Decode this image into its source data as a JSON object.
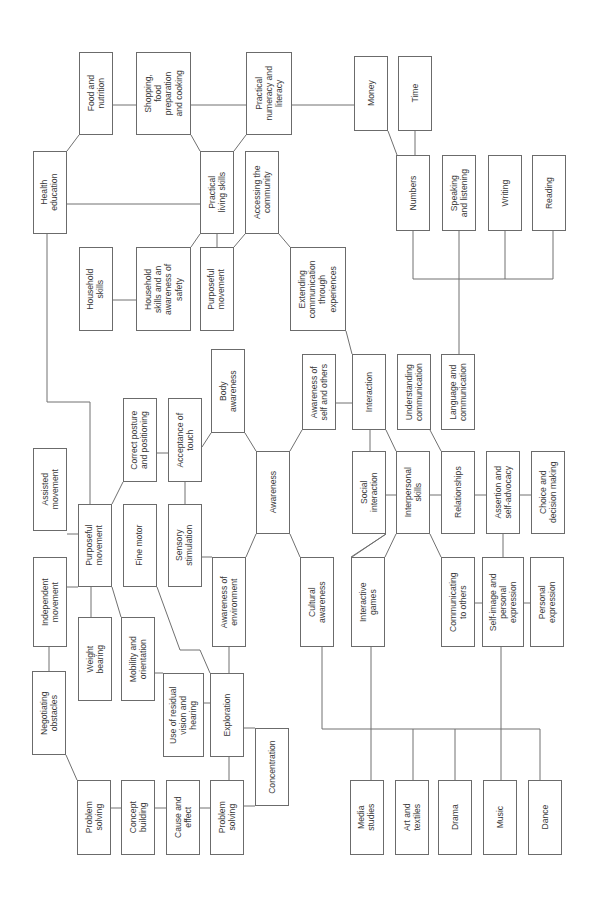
{
  "diagram": {
    "title": "",
    "orientation": "rotated-90-ccw",
    "colors": {
      "line": "#707070",
      "box_border": "#6b6b6b",
      "text": "#3a3a3a",
      "background": "#ffffff"
    },
    "nodes": [
      {
        "id": "food_nutrition",
        "label": "Food and\nnutrition",
        "x": 79,
        "y": 52,
        "w": 34,
        "h": 83
      },
      {
        "id": "shopping",
        "label": "Shopping,\nfood\npreparation\nand cooking",
        "x": 136,
        "y": 52,
        "w": 55,
        "h": 83
      },
      {
        "id": "practical_numeracy",
        "label": "Practical\nnumeracy and\nliteracy",
        "x": 246,
        "y": 52,
        "w": 46,
        "h": 83
      },
      {
        "id": "money",
        "label": "Money",
        "x": 354,
        "y": 56,
        "w": 34,
        "h": 75
      },
      {
        "id": "time",
        "label": "Time",
        "x": 398,
        "y": 56,
        "w": 34,
        "h": 75
      },
      {
        "id": "health_education",
        "label": "Health\neducation",
        "x": 33,
        "y": 151,
        "w": 34,
        "h": 83
      },
      {
        "id": "practical_living",
        "label": "Practical\nliving skills",
        "x": 200,
        "y": 151,
        "w": 34,
        "h": 83
      },
      {
        "id": "accessing_community",
        "label": "Accessing the\ncommunity",
        "x": 245,
        "y": 151,
        "w": 34,
        "h": 83
      },
      {
        "id": "numbers",
        "label": "Numbers",
        "x": 396,
        "y": 155,
        "w": 34,
        "h": 76
      },
      {
        "id": "speaking_listening",
        "label": "Speaking\nand listening",
        "x": 442,
        "y": 155,
        "w": 34,
        "h": 76
      },
      {
        "id": "writing",
        "label": "Writing",
        "x": 488,
        "y": 155,
        "w": 34,
        "h": 76
      },
      {
        "id": "reading",
        "label": "Reading",
        "x": 532,
        "y": 155,
        "w": 34,
        "h": 76
      },
      {
        "id": "household_skills",
        "label": "Household\nskills",
        "x": 79,
        "y": 247,
        "w": 34,
        "h": 84
      },
      {
        "id": "household_safety",
        "label": "Household\nskills and an\nawareness of\nsafety",
        "x": 136,
        "y": 247,
        "w": 55,
        "h": 84
      },
      {
        "id": "purposeful_movement_top",
        "label": "Purposeful\nmovement",
        "x": 200,
        "y": 247,
        "w": 34,
        "h": 84
      },
      {
        "id": "extending_communication",
        "label": "Extending\ncommunication\nthrough\nexperiences",
        "x": 290,
        "y": 247,
        "w": 56,
        "h": 84
      },
      {
        "id": "body_awareness",
        "label": "Body\nawareness",
        "x": 211,
        "y": 349,
        "w": 34,
        "h": 84
      },
      {
        "id": "correct_posture",
        "label": "Correct posture\nand positioning",
        "x": 123,
        "y": 398,
        "w": 34,
        "h": 84
      },
      {
        "id": "acceptance_touch",
        "label": "Acceptance of\ntouch",
        "x": 168,
        "y": 398,
        "w": 34,
        "h": 84
      },
      {
        "id": "awareness_self_others",
        "label": "Awareness of\nself and others",
        "x": 302,
        "y": 354,
        "w": 34,
        "h": 76
      },
      {
        "id": "interaction",
        "label": "Interaction",
        "x": 352,
        "y": 354,
        "w": 34,
        "h": 76
      },
      {
        "id": "understanding_communication",
        "label": "Understanding\ncommunication",
        "x": 397,
        "y": 354,
        "w": 34,
        "h": 76
      },
      {
        "id": "language_communication",
        "label": "Language and\ncommunication",
        "x": 441,
        "y": 354,
        "w": 34,
        "h": 76
      },
      {
        "id": "assisted_movement",
        "label": "Assisted\nmovement",
        "x": 33,
        "y": 448,
        "w": 34,
        "h": 83
      },
      {
        "id": "awareness",
        "label": "Awareness",
        "x": 256,
        "y": 451,
        "w": 34,
        "h": 83
      },
      {
        "id": "social_interaction",
        "label": "Social\ninteraction",
        "x": 352,
        "y": 451,
        "w": 34,
        "h": 83
      },
      {
        "id": "interpersonal_skills",
        "label": "Interpersonal\nskills",
        "x": 396,
        "y": 451,
        "w": 34,
        "h": 83
      },
      {
        "id": "relationships",
        "label": "Relationships",
        "x": 441,
        "y": 451,
        "w": 34,
        "h": 83
      },
      {
        "id": "assertion_self_advocacy",
        "label": "Assertion and\nself-advocacy",
        "x": 486,
        "y": 451,
        "w": 34,
        "h": 83
      },
      {
        "id": "choice_decision",
        "label": "Choice and\ndecision making",
        "x": 531,
        "y": 451,
        "w": 34,
        "h": 83
      },
      {
        "id": "purposeful_movement",
        "label": "Purposeful\nmovement",
        "x": 78,
        "y": 504,
        "w": 34,
        "h": 83
      },
      {
        "id": "fine_motor",
        "label": "Fine motor",
        "x": 123,
        "y": 504,
        "w": 34,
        "h": 83
      },
      {
        "id": "sensory_stimulation",
        "label": "Sensory\nstimulation",
        "x": 168,
        "y": 504,
        "w": 34,
        "h": 83
      },
      {
        "id": "independent_movement",
        "label": "Independent\nmovement",
        "x": 33,
        "y": 557,
        "w": 34,
        "h": 90
      },
      {
        "id": "awareness_environment",
        "label": "Awareness of\nenvironment",
        "x": 212,
        "y": 557,
        "w": 34,
        "h": 90
      },
      {
        "id": "cultural_awareness",
        "label": "Cultural\nawareness",
        "x": 300,
        "y": 557,
        "w": 34,
        "h": 90
      },
      {
        "id": "interactive_games",
        "label": "Interactive\ngames",
        "x": 351,
        "y": 557,
        "w": 34,
        "h": 90
      },
      {
        "id": "communicating_others",
        "label": "Communicating\nto others",
        "x": 441,
        "y": 557,
        "w": 34,
        "h": 90
      },
      {
        "id": "self_image",
        "label": "Self-image and\npersonal\nexpression",
        "x": 482,
        "y": 557,
        "w": 42,
        "h": 90
      },
      {
        "id": "personal_expression",
        "label": "Personal\nexpression",
        "x": 530,
        "y": 557,
        "w": 34,
        "h": 90
      },
      {
        "id": "weight_bearing",
        "label": "Weight\nbearing",
        "x": 78,
        "y": 617,
        "w": 34,
        "h": 84
      },
      {
        "id": "mobility_orientation",
        "label": "Mobility and\norientation",
        "x": 121,
        "y": 617,
        "w": 34,
        "h": 84
      },
      {
        "id": "negotiating_obstacles",
        "label": "Negotiating\nobstacles",
        "x": 32,
        "y": 671,
        "w": 34,
        "h": 84
      },
      {
        "id": "residual_vision",
        "label": "Use of residual\nvision and\nhearing",
        "x": 163,
        "y": 673,
        "w": 41,
        "h": 84
      },
      {
        "id": "exploration",
        "label": "Exploration",
        "x": 210,
        "y": 673,
        "w": 34,
        "h": 84
      },
      {
        "id": "concentration",
        "label": "Concentration",
        "x": 255,
        "y": 728,
        "w": 34,
        "h": 78
      },
      {
        "id": "problem_solving_1",
        "label": "Problem\nsolving",
        "x": 77,
        "y": 780,
        "w": 34,
        "h": 75
      },
      {
        "id": "concept_building",
        "label": "Concept\nbuilding",
        "x": 121,
        "y": 780,
        "w": 34,
        "h": 75
      },
      {
        "id": "cause_effect",
        "label": "Cause and\neffect",
        "x": 166,
        "y": 780,
        "w": 34,
        "h": 75
      },
      {
        "id": "problem_solving_2",
        "label": "Problem\nsolving",
        "x": 210,
        "y": 780,
        "w": 34,
        "h": 75
      },
      {
        "id": "media_studies",
        "label": "Media\nstudies",
        "x": 350,
        "y": 780,
        "w": 34,
        "h": 75
      },
      {
        "id": "art_textiles",
        "label": "Art and\ntextiles",
        "x": 395,
        "y": 780,
        "w": 34,
        "h": 75
      },
      {
        "id": "drama",
        "label": "Drama",
        "x": 438,
        "y": 780,
        "w": 34,
        "h": 75
      },
      {
        "id": "music",
        "label": "Music",
        "x": 483,
        "y": 780,
        "w": 34,
        "h": 75
      },
      {
        "id": "dance",
        "label": "Dance",
        "x": 528,
        "y": 780,
        "w": 34,
        "h": 75
      }
    ],
    "links": [
      [
        113,
        105,
        136,
        105
      ],
      [
        191,
        105,
        246,
        105
      ],
      [
        292,
        105,
        354,
        105
      ],
      [
        67,
        151,
        79,
        135
      ],
      [
        191,
        135,
        200,
        151
      ],
      [
        246,
        135,
        234,
        151
      ],
      [
        67,
        204,
        200,
        204
      ],
      [
        388,
        131,
        397,
        155
      ],
      [
        415,
        131,
        415,
        155
      ],
      [
        113,
        300,
        136,
        300
      ],
      [
        191,
        247,
        200,
        234
      ],
      [
        217,
        234,
        217,
        247
      ],
      [
        234,
        247,
        245,
        234
      ],
      [
        279,
        234,
        290,
        247
      ],
      [
        47,
        234,
        47,
        402,
        90,
        402,
        90,
        504
      ],
      [
        413,
        231,
        413,
        279,
        553,
        279,
        553,
        231
      ],
      [
        459,
        231,
        459,
        354
      ],
      [
        505,
        231,
        505,
        279
      ],
      [
        346,
        331,
        352,
        354
      ],
      [
        336,
        403,
        352,
        403
      ],
      [
        370,
        430,
        370,
        451
      ],
      [
        386,
        430,
        396,
        451
      ],
      [
        430,
        430,
        441,
        451
      ],
      [
        386,
        495,
        396,
        495
      ],
      [
        430,
        495,
        441,
        495
      ],
      [
        475,
        495,
        486,
        495
      ],
      [
        520,
        495,
        531,
        495
      ],
      [
        245,
        433,
        256,
        451
      ],
      [
        157,
        453,
        168,
        453
      ],
      [
        185,
        482,
        185,
        504
      ],
      [
        202,
        447,
        211,
        433
      ],
      [
        112,
        504,
        123,
        482
      ],
      [
        290,
        451,
        302,
        430
      ],
      [
        290,
        534,
        300,
        557
      ],
      [
        351,
        557,
        386,
        534
      ],
      [
        386,
        534,
        352,
        557
      ],
      [
        396,
        534,
        385,
        557
      ],
      [
        430,
        534,
        441,
        557
      ],
      [
        503,
        534,
        503,
        557
      ],
      [
        475,
        603,
        482,
        603
      ],
      [
        524,
        603,
        530,
        603
      ],
      [
        67,
        534,
        78,
        534
      ],
      [
        67,
        587,
        78,
        587
      ],
      [
        91,
        587,
        91,
        617
      ],
      [
        112,
        587,
        121,
        617
      ],
      [
        202,
        557,
        212,
        557
      ],
      [
        246,
        557,
        256,
        534
      ],
      [
        157,
        587,
        180,
        650,
        200,
        650,
        210,
        673
      ],
      [
        229,
        647,
        229,
        673
      ],
      [
        155,
        673,
        163,
        673
      ],
      [
        204,
        703,
        210,
        703
      ],
      [
        244,
        728,
        255,
        728
      ],
      [
        49,
        647,
        49,
        671
      ],
      [
        66,
        755,
        77,
        780
      ],
      [
        111,
        808,
        121,
        808
      ],
      [
        155,
        808,
        166,
        808
      ],
      [
        200,
        808,
        210,
        808
      ],
      [
        229,
        757,
        229,
        780
      ],
      [
        244,
        806,
        255,
        806
      ],
      [
        322,
        647,
        322,
        729,
        540,
        729,
        540,
        780
      ],
      [
        371,
        647,
        371,
        780
      ],
      [
        413,
        729,
        413,
        780
      ],
      [
        455,
        729,
        455,
        780
      ],
      [
        501,
        647,
        501,
        780
      ]
    ]
  }
}
